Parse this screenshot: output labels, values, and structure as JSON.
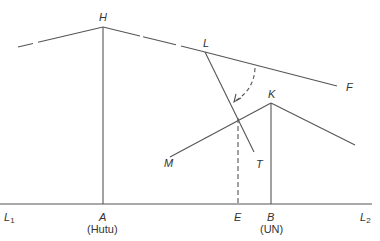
{
  "diagram": {
    "stroke_color": "#555555",
    "labels": {
      "H": "H",
      "L": "L",
      "F": "F",
      "K": "K",
      "M": "M",
      "T": "T",
      "L1_main": "L",
      "L1_sub": "1",
      "L2_main": "L",
      "L2_sub": "2",
      "A": "A",
      "A_note": "(Hutu)",
      "E": "E",
      "B": "B",
      "B_note": "(UN)"
    },
    "points": {
      "H": [
        103,
        27
      ],
      "L": [
        205,
        52
      ],
      "F": [
        337,
        86
      ],
      "K": [
        271,
        103
      ],
      "M": [
        170,
        157
      ],
      "T": [
        254,
        152
      ],
      "A": [
        103,
        204
      ],
      "E": [
        238,
        204
      ],
      "B": [
        271,
        204
      ],
      "L1": [
        0,
        204
      ],
      "L2": [
        372,
        204
      ]
    }
  }
}
